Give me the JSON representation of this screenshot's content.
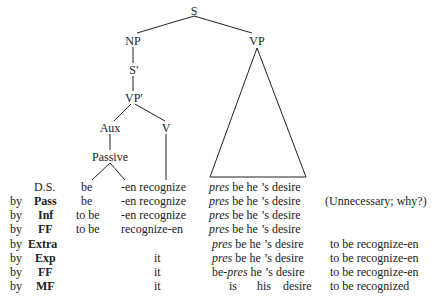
{
  "tree": {
    "nodes": {
      "S": "S",
      "NP": "NP",
      "VP": "VP",
      "S_bar": "S′",
      "VP_bar": "VP′",
      "Aux": "Aux",
      "V": "V",
      "Passive": "Passive"
    }
  },
  "derivation": {
    "rows": [
      {
        "by": "",
        "rule": "D.S.",
        "aux": "be",
        "verb": "-en recognize",
        "pres": "pres",
        "rest": " be he ’s desire",
        "extra": "(Unnecessary; why?)"
      },
      {
        "by": "by",
        "rule": "Pass",
        "aux": "be",
        "verb": "-en recognize",
        "pres": "pres",
        "rest": " be he ’s desire",
        "extra": "(Unnecessary; why?)"
      },
      {
        "by": "by",
        "rule": "Inf",
        "aux": "to be",
        "verb": "-en recognize",
        "pres": "pres",
        "rest": " be he ’s desire",
        "extra": ""
      },
      {
        "by": "by",
        "rule": "FF",
        "aux": "to be",
        "verb": "recognize-en",
        "pres": "pres",
        "rest": " be he ’s desire",
        "extra": ""
      },
      {
        "by": "by",
        "rule": "Extra",
        "aux": "",
        "verb": "",
        "pres": "pres",
        "rest": " be he ’s desire",
        "extra": "to be recognize-en"
      },
      {
        "by": "by",
        "rule": "Exp",
        "aux": "",
        "verb": "it",
        "pres": "pres",
        "rest": " be he ’s desire",
        "extra": "to be recognize-en"
      },
      {
        "by": "by",
        "rule": "FF",
        "aux": "",
        "verb": "it",
        "pres_prefix": "be-",
        "pres": "pres",
        "rest": " he ’s desire",
        "extra": "to be recognize-en"
      },
      {
        "by": "by",
        "rule": "MF",
        "aux": "",
        "verb": "it",
        "pres": "",
        "rest": "is      his   desire",
        "extra": "to be recognized"
      }
    ],
    "row0": {
      "rule": "D.S.",
      "aux": "be",
      "verb": "-en recognize",
      "pres": "pres",
      "rest": " be he ’s desire"
    },
    "row1": {
      "by": "by",
      "rule": "Pass",
      "aux": "be",
      "verb": "-en recognize",
      "pres": "pres",
      "rest": " be he ’s desire",
      "extra": "(Unnecessary; why?)"
    },
    "row2": {
      "by": "by",
      "rule": "Inf",
      "aux": "to be",
      "verb": "-en recognize",
      "pres": "pres",
      "rest": " be he ’s desire"
    },
    "row3": {
      "by": "by",
      "rule": "FF",
      "aux": "to be",
      "verb": "recognize-en",
      "pres": "pres",
      "rest": " be he ’s desire"
    },
    "row4": {
      "by": "by",
      "rule": "Extra",
      "pres": "pres",
      "rest": " be he ’s desire",
      "extra": "to be recognize-en"
    },
    "row5": {
      "by": "by",
      "rule": "Exp",
      "verb": "it",
      "pres": "pres",
      "rest": " be he ’s desire",
      "extra": "to be recognize-en"
    },
    "row6": {
      "by": "by",
      "rule": "FF",
      "verb": "it",
      "prefix": "be-",
      "pres": "pres",
      "rest": " he ’s desire",
      "extra": "to be recognize-en"
    },
    "row7": {
      "by": "by",
      "rule": "MF",
      "verb": "it",
      "is": "is",
      "his": "his",
      "desire": "desire",
      "extra": "to be recognized"
    }
  }
}
